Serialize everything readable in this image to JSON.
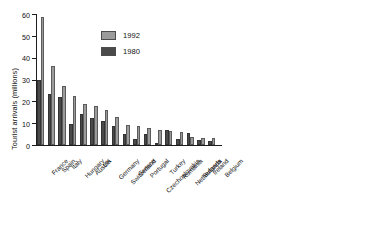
{
  "chart_data": [
    {
      "id": "europe",
      "type": "bar",
      "title": "",
      "xlabel": "",
      "ylabel": "Tourist arrivals (millions)",
      "ylim": [
        0,
        60
      ],
      "yticks": [
        0,
        10,
        20,
        30,
        40,
        50,
        60
      ],
      "grid": false,
      "legend_position": "inside-upper-center",
      "categories": [
        "France",
        "Spain",
        "Italy",
        "Hungary",
        "Austria",
        "UK",
        "Germany",
        "Switzerland",
        "Greece",
        "Portugal",
        "Czechoslovakia",
        "Turkey",
        "Romania",
        "Netherlands",
        "Bulgaria",
        "Ireland",
        "Belgium"
      ],
      "series": [
        {
          "name": "1980",
          "color": "#4a4a4a",
          "values": [
            30.0,
            23.5,
            22.0,
            9.5,
            14.0,
            12.3,
            11.2,
            8.8,
            5.0,
            2.8,
            5.2,
            0.9,
            6.7,
            2.8,
            5.5,
            2.3,
            1.8
          ]
        },
        {
          "name": "1992",
          "color": "#9b9b9b",
          "values": [
            58.5,
            36.0,
            27.0,
            22.5,
            19.0,
            18.0,
            16.0,
            13.0,
            9.0,
            8.8,
            8.0,
            6.7,
            6.3,
            6.0,
            3.8,
            3.2,
            3.2
          ]
        }
      ]
    },
    {
      "id": "americas-asia",
      "type": "bar",
      "title": "",
      "xlabel": "",
      "ylabel": "",
      "ylim": [
        0,
        60
      ],
      "yticks": [
        0,
        10,
        20,
        30,
        40,
        50,
        60
      ],
      "grid": false,
      "categories": [
        "USA",
        "Mexico",
        "Canada",
        "China",
        "Hong Kong",
        "Malaysia",
        "Singapore",
        "Thailand"
      ],
      "series": [
        {
          "name": "1980",
          "color": "#4a4a4a",
          "values": [
            22.5,
            12.0,
            12.9,
            3.5,
            1.7,
            2.1,
            2.4,
            1.8
          ]
        },
        {
          "name": "1992",
          "color": "#9b9b9b",
          "values": [
            45.5,
            17.5,
            16.3,
            14.0,
            6.8,
            6.0,
            5.1,
            5.1
          ]
        }
      ]
    }
  ],
  "legend": {
    "items": [
      {
        "label": "1992",
        "color": "#9b9b9b"
      },
      {
        "label": "1980",
        "color": "#4a4a4a"
      }
    ]
  }
}
